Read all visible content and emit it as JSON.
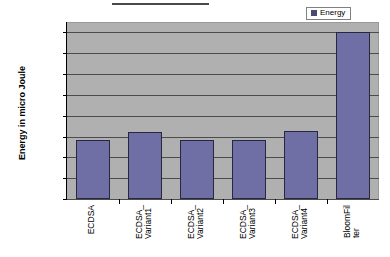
{
  "legend": {
    "entries": [
      {
        "label": "Energy",
        "color": "#4a4a6e"
      }
    ],
    "position": "top-right"
  },
  "axes": {
    "y_title": "Energy in micro Joule",
    "y_ticks": [
      "53911.2",
      "53911",
      "53910.8",
      "53910.6",
      "53910.4",
      "53910.2",
      "53910",
      "53909.8",
      "53909.6"
    ]
  },
  "categories": [
    {
      "line1": "ECDSA",
      "line2": ""
    },
    {
      "line1": "ECDSA_",
      "line2": "Variant1"
    },
    {
      "line1": "ECDSA_",
      "line2": "Variant2"
    },
    {
      "line1": "ECDSA_",
      "line2": "Variant3"
    },
    {
      "line1": "ECDSA_",
      "line2": "Variant4"
    },
    {
      "line1": "BloomFil",
      "line2": "ter"
    }
  ],
  "colors": {
    "bar_fill": "#6f6fa5",
    "bar_border": "#27273f",
    "plot_background": "#b0b0b0",
    "gridline": "#4c4c4c",
    "page_background": "#ffffff"
  },
  "chart_data": {
    "type": "bar",
    "title": "",
    "xlabel": "",
    "ylabel": "Energy in micro Joule",
    "categories": [
      "ECDSA",
      "ECDSA_Variant1",
      "ECDSA_Variant2",
      "ECDSA_Variant3",
      "ECDSA_Variant4",
      "BloomFilter"
    ],
    "series": [
      {
        "name": "Energy",
        "values": [
          53910.17,
          53910.24,
          53910.17,
          53910.17,
          53910.25,
          53911.2
        ]
      }
    ],
    "ylim": [
      53909.6,
      53911.3
    ],
    "ytick_step": 0.2,
    "yticks": [
      53909.6,
      53909.8,
      53910.0,
      53910.2,
      53910.4,
      53910.6,
      53910.8,
      53911.0,
      53911.2
    ],
    "grid": true,
    "legend_position": "top-right"
  }
}
